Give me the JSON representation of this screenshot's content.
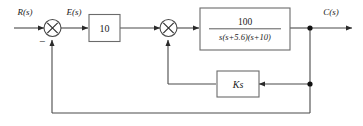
{
  "diagram": {
    "type": "control-system-block-diagram",
    "background_color": "#ffffff",
    "line_color": "#4a4a4a",
    "text_color": "#1a1a1a",
    "signals": {
      "input": "R(s)",
      "error": "E(s)",
      "output": "C(s)"
    },
    "blocks": [
      {
        "id": "gain",
        "label": "10"
      },
      {
        "id": "plant",
        "numerator": "100",
        "denominator": "s(s+5.6)(s+10)"
      },
      {
        "id": "inner_feedback",
        "label": "Ks"
      }
    ],
    "summing_junctions": [
      {
        "id": "sum1",
        "glyph": "×",
        "feedback_sign": "−"
      },
      {
        "id": "sum2",
        "glyph": "×",
        "feedback_sign": ""
      }
    ]
  }
}
